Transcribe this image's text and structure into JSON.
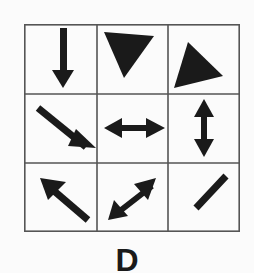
{
  "puzzle": {
    "option_label": "D",
    "grid": {
      "rows": 3,
      "cols": 3,
      "cells": [
        {
          "row": 0,
          "col": 0,
          "shape": "arrow-down"
        },
        {
          "row": 0,
          "col": 1,
          "shape": "triangle-pointing-down"
        },
        {
          "row": 0,
          "col": 2,
          "shape": "triangle-pointing-right"
        },
        {
          "row": 1,
          "col": 0,
          "shape": "arrow-down-right"
        },
        {
          "row": 1,
          "col": 1,
          "shape": "double-arrow-horizontal"
        },
        {
          "row": 1,
          "col": 2,
          "shape": "double-arrow-vertical"
        },
        {
          "row": 2,
          "col": 0,
          "shape": "arrow-up-left"
        },
        {
          "row": 2,
          "col": 1,
          "shape": "double-arrow-diagonal"
        },
        {
          "row": 2,
          "col": 2,
          "shape": "diagonal-line"
        }
      ]
    },
    "colors": {
      "ink": "#1a1a1a",
      "grid_line": "#555555",
      "background": "#fbfbfb"
    }
  }
}
